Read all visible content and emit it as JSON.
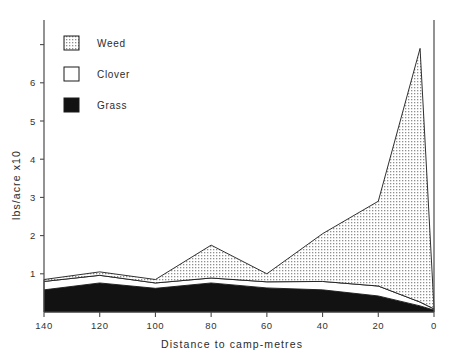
{
  "chart_data": {
    "type": "area",
    "title": "",
    "xlabel": "Distance to camp-metres",
    "ylabel": "lbs/acre x10",
    "stacked": true,
    "x": [
      140,
      120,
      100,
      80,
      60,
      40,
      20,
      5,
      0
    ],
    "xlim": [
      140,
      0
    ],
    "ylim": [
      0,
      7.4
    ],
    "xticks": [
      "140",
      "120",
      "100",
      "80",
      "60",
      "40",
      "20",
      "0"
    ],
    "xtick_values": [
      140,
      120,
      100,
      80,
      60,
      40,
      20,
      0
    ],
    "yticks": [
      "1",
      "2",
      "3",
      "4",
      "5",
      "6",
      "7"
    ],
    "ytick_values": [
      1,
      2,
      3,
      4,
      5,
      6,
      7
    ],
    "grid": false,
    "legend_position": "upper-left",
    "series": [
      {
        "name": "Grass",
        "fill": "solid-black",
        "color": "#111111",
        "values": [
          0.58,
          0.76,
          0.62,
          0.76,
          0.63,
          0.58,
          0.42,
          0.16,
          0.05
        ]
      },
      {
        "name": "Clover",
        "fill": "white",
        "color": "#ffffff",
        "values": [
          0.22,
          0.2,
          0.14,
          0.13,
          0.16,
          0.22,
          0.26,
          0.1,
          0.03
        ]
      },
      {
        "name": "Weed",
        "fill": "dotted-hatch",
        "color": "#c9c9c9",
        "values": [
          0.05,
          0.09,
          0.09,
          0.86,
          0.21,
          1.25,
          2.22,
          6.64,
          0.02
        ]
      }
    ],
    "totals": [
      0.85,
      1.05,
      0.85,
      1.75,
      1.0,
      2.05,
      2.9,
      6.9,
      0.1
    ],
    "annotations": []
  },
  "legend": {
    "items": [
      {
        "label": "Weed",
        "swatch": "dotted-hatch"
      },
      {
        "label": "Clover",
        "swatch": "white"
      },
      {
        "label": "Grass",
        "swatch": "solid-black"
      }
    ]
  },
  "axes": {
    "y_title": "lbs/acre x10",
    "x_title": "Distance to camp-metres"
  }
}
